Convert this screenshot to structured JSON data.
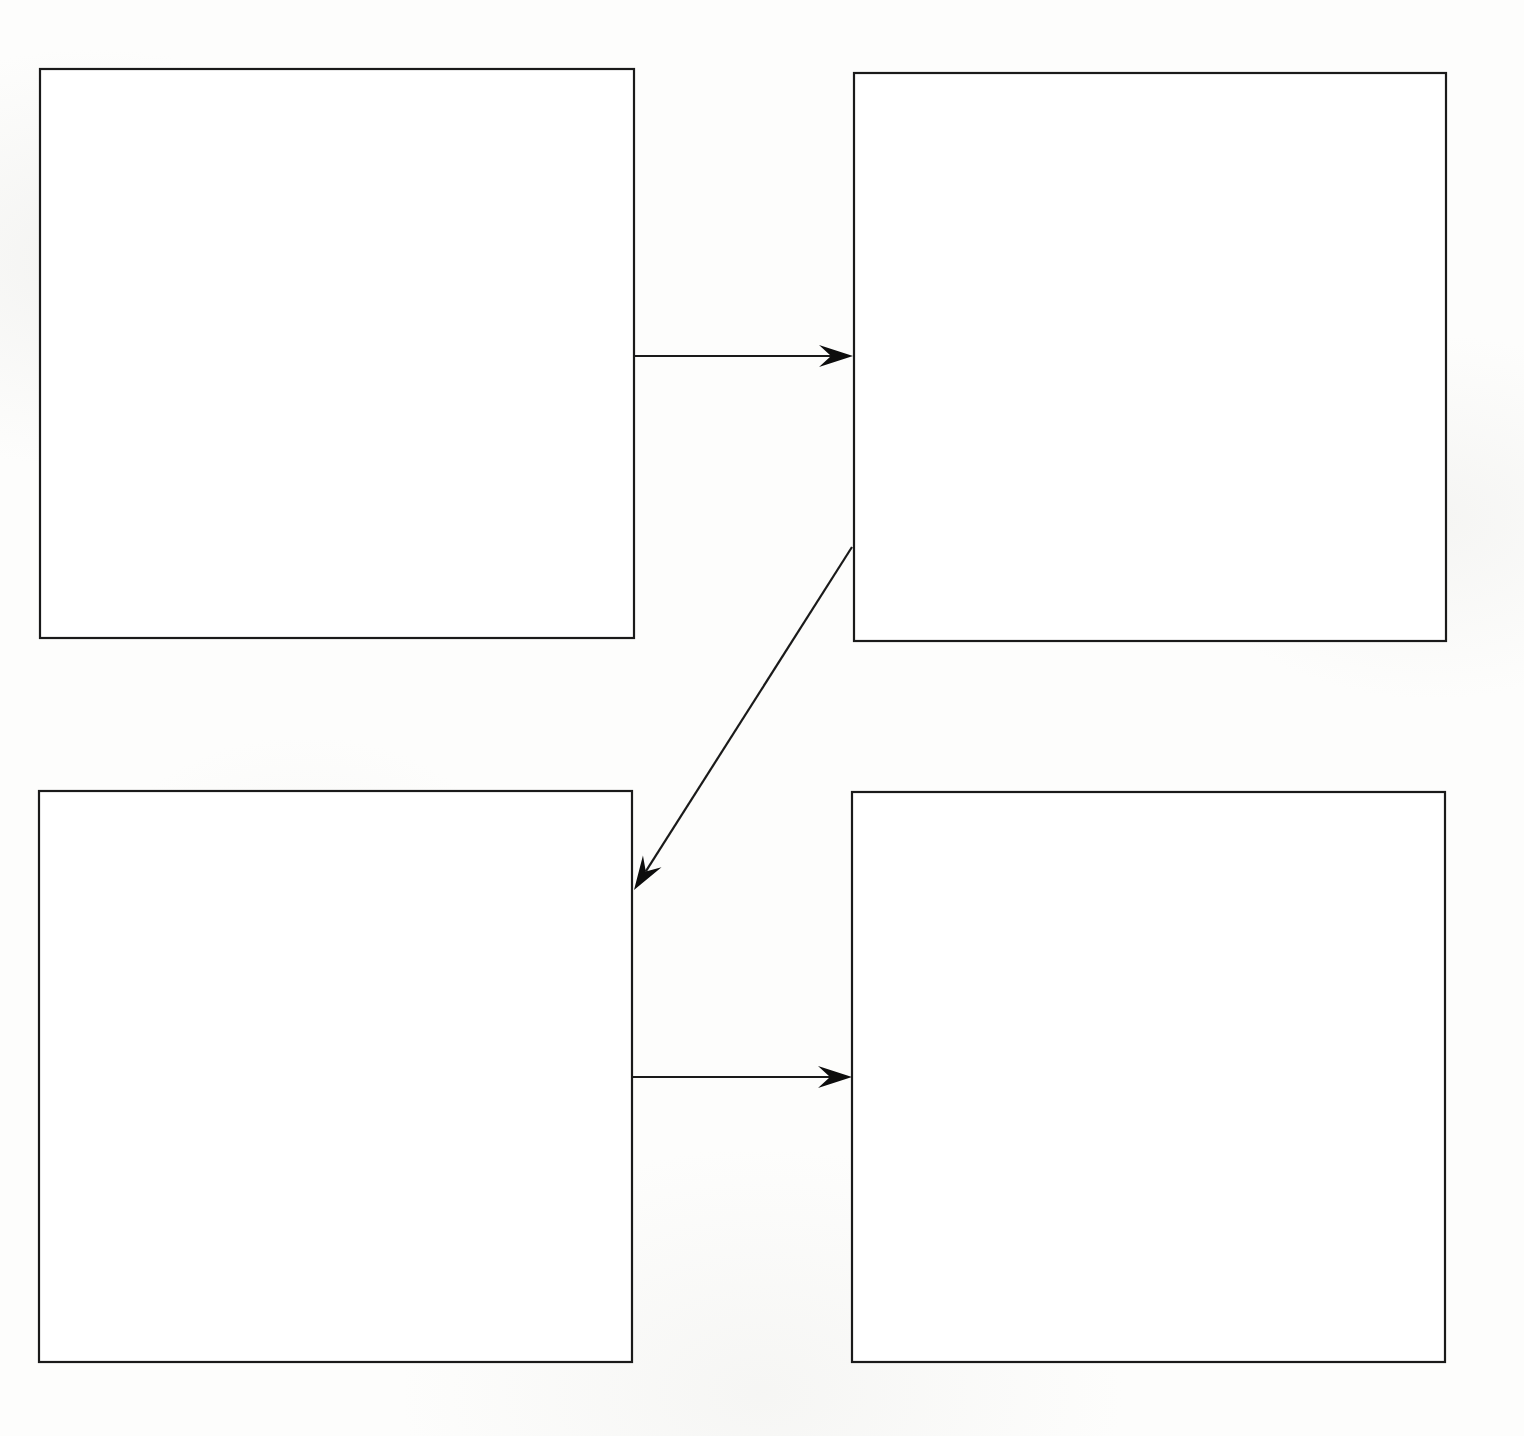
{
  "document": {
    "title": "Four-Box Flow Diagram",
    "kind": "diagram",
    "background_color": "#fdfdfc",
    "stroke_color": "#1a1a1a",
    "canvas": {
      "width": 1524,
      "height": 1436
    }
  },
  "diagram": {
    "type": "flow-diagram",
    "node_count": 4,
    "edge_count": 3,
    "nodes": [
      {
        "id": "box-top-left",
        "label": "",
        "shape": "rectangle",
        "fill": "#ffffff",
        "stroke": "#1a1a1a",
        "x": 40,
        "y": 69,
        "width": 594,
        "height": 569
      },
      {
        "id": "box-top-right",
        "label": "",
        "shape": "rectangle",
        "fill": "#ffffff",
        "stroke": "#1a1a1a",
        "x": 854,
        "y": 73,
        "width": 592,
        "height": 568
      },
      {
        "id": "box-bottom-left",
        "label": "",
        "shape": "rectangle",
        "fill": "#ffffff",
        "stroke": "#1a1a1a",
        "x": 39,
        "y": 791,
        "width": 593,
        "height": 571
      },
      {
        "id": "box-bottom-right",
        "label": "",
        "shape": "rectangle",
        "fill": "#ffffff",
        "stroke": "#1a1a1a",
        "x": 852,
        "y": 792,
        "width": 593,
        "height": 570
      }
    ],
    "edges": [
      {
        "id": "edge-top-left-to-top-right",
        "label": "",
        "from": "box-top-left",
        "to": "box-top-right",
        "style": "solid",
        "arrowhead": "barbed",
        "direction": "horizontal-right",
        "x1": 634,
        "y1": 356,
        "x2": 853,
        "y2": 356
      },
      {
        "id": "edge-top-right-to-bottom-left",
        "label": "",
        "from": "box-top-right",
        "to": "box-bottom-left",
        "style": "solid",
        "arrowhead": "barbed",
        "direction": "diagonal-down-left",
        "x1": 852,
        "y1": 547,
        "x2": 634,
        "y2": 890
      },
      {
        "id": "edge-bottom-left-to-bottom-right",
        "label": "",
        "from": "box-bottom-left",
        "to": "box-bottom-right",
        "style": "solid",
        "arrowhead": "barbed",
        "direction": "horizontal-right",
        "x1": 633,
        "y1": 1077,
        "x2": 852,
        "y2": 1077
      }
    ]
  }
}
